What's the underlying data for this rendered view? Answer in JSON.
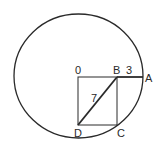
{
  "diagram": {
    "type": "geometry",
    "points": {
      "O": {
        "label": "0",
        "x": 78,
        "y": 77
      },
      "B": {
        "label": "B",
        "x": 117,
        "y": 77
      },
      "A": {
        "label": "A",
        "x": 143,
        "y": 77
      },
      "C": {
        "label": "C",
        "x": 117,
        "y": 125
      },
      "D": {
        "label": "D",
        "x": 78,
        "y": 125
      }
    },
    "segment_labels": {
      "BD": "7",
      "BA": "3"
    },
    "circle": {
      "cx": 78.5,
      "cy": 76,
      "rx": 64.5,
      "ry": 62
    },
    "stroke_color": "#2a2a2a",
    "background": "#ffffff"
  }
}
